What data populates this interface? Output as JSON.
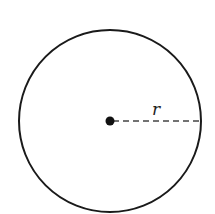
{
  "diagram": {
    "type": "circle-radius",
    "center": {
      "x": 110,
      "y": 121
    },
    "radius_px": 91,
    "radius_label": "r",
    "stroke_color": "#1a1a1a",
    "dash_color": "#444444"
  }
}
